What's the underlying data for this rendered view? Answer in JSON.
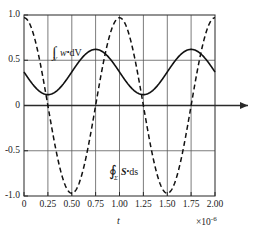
{
  "chart_data": {
    "type": "line",
    "title": "",
    "subtitle": "",
    "xlabel": "t",
    "ylabel": "",
    "x_multiplier": "×10",
    "x_multiplier_exponent": "-6",
    "xlim": [
      0,
      2.0
    ],
    "ylim": [
      -1.0,
      1.0
    ],
    "grid": true,
    "legend_position": "inline-annotation",
    "xticks": [
      0,
      0.25,
      0.5,
      0.75,
      1.0,
      1.25,
      1.5,
      1.75,
      2.0
    ],
    "xticklabels": [
      "0",
      "0.25",
      "0.50",
      "0.75",
      "1.00",
      "1.25",
      "1.50",
      "1.75",
      "2.00"
    ],
    "yticks": [
      1.0,
      0.5,
      0,
      -0.5,
      -1.0
    ],
    "yticklabels": [
      "1.0",
      "0.5",
      "0",
      "-0.5",
      "-1.0"
    ],
    "series": [
      {
        "name": "integral_w_dV",
        "style": "solid",
        "color": "#111111",
        "annotation_parts": {
          "integral_symbol": "∫",
          "subscript": "V",
          "integrand": "w",
          "dot": "•",
          "differential": "dV"
        },
        "annotation_text": "∫_V w·dV",
        "formula": "0.37 + 0.25*(1 - cos(2*pi*(t-0.25)/1.0))",
        "description": "Raised cosine, period 1.0 ×10^-6 s, min 0.12 at t=0.25 and t=1.25, max 0.62 at t=0.75 and t=1.75, value 0.37 at t=0",
        "amplitude": 0.25,
        "offset": 0.37,
        "period": 1.0,
        "phase_min_at": 0.25,
        "points": [
          {
            "t": 0.0,
            "y": 0.37
          },
          {
            "t": 0.125,
            "y": 0.19
          },
          {
            "t": 0.25,
            "y": 0.12
          },
          {
            "t": 0.375,
            "y": 0.19
          },
          {
            "t": 0.5,
            "y": 0.37
          },
          {
            "t": 0.625,
            "y": 0.55
          },
          {
            "t": 0.75,
            "y": 0.62
          },
          {
            "t": 0.875,
            "y": 0.55
          },
          {
            "t": 1.0,
            "y": 0.37
          },
          {
            "t": 1.125,
            "y": 0.19
          },
          {
            "t": 1.25,
            "y": 0.12
          },
          {
            "t": 1.375,
            "y": 0.19
          },
          {
            "t": 1.5,
            "y": 0.37
          },
          {
            "t": 1.625,
            "y": 0.55
          },
          {
            "t": 1.75,
            "y": 0.62
          },
          {
            "t": 1.875,
            "y": 0.55
          },
          {
            "t": 2.0,
            "y": 0.37
          }
        ]
      },
      {
        "name": "contour_integral_S_ds",
        "style": "dashed",
        "color": "#111111",
        "annotation_parts": {
          "integral_symbol": "∮",
          "subscript": "Σ",
          "integrand": "S",
          "dot": "•",
          "differential": "ds"
        },
        "annotation_text": "∮_Σ S·ds",
        "formula": "cos(2*pi*t/1.0)",
        "description": "Cosine, period 1.0 ×10^-6 s, amplitude ~0.97, starts near +0.97 at t=0, min -0.97 at t=0.50 and t=1.50, max +0.97 at t=1.00 and t=2.00",
        "amplitude": 0.97,
        "offset": 0.0,
        "period": 1.0,
        "points": [
          {
            "t": 0.0,
            "y": 0.97
          },
          {
            "t": 0.125,
            "y": 0.69
          },
          {
            "t": 0.25,
            "y": 0.0
          },
          {
            "t": 0.375,
            "y": -0.69
          },
          {
            "t": 0.5,
            "y": -0.97
          },
          {
            "t": 0.625,
            "y": -0.69
          },
          {
            "t": 0.75,
            "y": 0.0
          },
          {
            "t": 0.875,
            "y": 0.69
          },
          {
            "t": 1.0,
            "y": 0.97
          },
          {
            "t": 1.125,
            "y": 0.69
          },
          {
            "t": 1.25,
            "y": 0.0
          },
          {
            "t": 1.375,
            "y": -0.69
          },
          {
            "t": 1.5,
            "y": -0.97
          },
          {
            "t": 1.625,
            "y": -0.69
          },
          {
            "t": 1.75,
            "y": 0.0
          },
          {
            "t": 1.875,
            "y": 0.69
          },
          {
            "t": 2.0,
            "y": 0.97
          }
        ]
      }
    ],
    "annotations": [
      {
        "name": "solid-curve-label",
        "text": "∫_V w·dV",
        "x": 0.3,
        "y": 0.52
      },
      {
        "name": "dashed-curve-label",
        "text": "∮_Σ S·ds",
        "x": 0.92,
        "y": -0.62
      }
    ],
    "axis_arrow": {
      "present": true,
      "direction": "right",
      "at_y": 0
    },
    "colors": {
      "axis": "#555555",
      "grid": "#555555",
      "curve": "#111111",
      "background": "#ffffff",
      "text": "#1a1a1a"
    }
  }
}
